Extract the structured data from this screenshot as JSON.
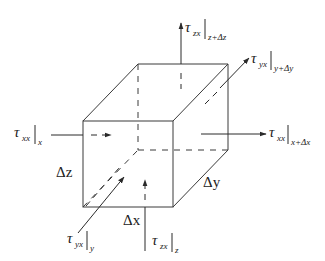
{
  "diagram": {
    "type": "3d-control-volume-cube",
    "dimensions": {
      "dx_label": "Δx",
      "dy_label": "Δy",
      "dz_label": "Δz"
    },
    "stress_labels": {
      "txx_x": {
        "symbol": "τ",
        "sub": "xx",
        "eval": "x"
      },
      "txx_xdx": {
        "symbol": "τ",
        "sub": "xx",
        "eval": "x+Δx"
      },
      "tyx_y": {
        "symbol": "τ",
        "sub": "yx",
        "eval": "y"
      },
      "tyx_ydy": {
        "symbol": "τ",
        "sub": "yx",
        "eval": "y+Δy"
      },
      "tzx_z": {
        "symbol": "τ",
        "sub": "zx",
        "eval": "z"
      },
      "tzx_zdz": {
        "symbol": "τ",
        "sub": "zx",
        "eval": "z+Δz"
      }
    },
    "colors": {
      "line": "#3a3a3a",
      "text": "#222222",
      "background": "#ffffff"
    }
  }
}
